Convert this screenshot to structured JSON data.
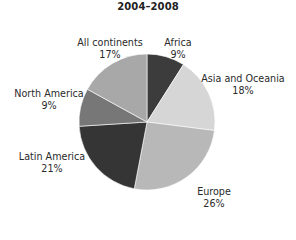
{
  "title": "2004–2008",
  "chart_data": {
    "type": "pie",
    "title": "2004–2008",
    "start_angle_deg": 0,
    "direction": "clockwise",
    "slices": [
      {
        "label": "Africa",
        "value": 9,
        "display": "9%",
        "color": "#3c3c3c"
      },
      {
        "label": "Asia and Oceania",
        "value": 18,
        "display": "18%",
        "color": "#d6d6d6"
      },
      {
        "label": "Europe",
        "value": 26,
        "display": "26%",
        "color": "#b8b8b8"
      },
      {
        "label": "Latin America",
        "value": 21,
        "display": "21%",
        "color": "#353535"
      },
      {
        "label": "North America",
        "value": 9,
        "display": "9%",
        "color": "#777777"
      },
      {
        "label": "All continents",
        "value": 17,
        "display": "17%",
        "color": "#a8a8a8"
      }
    ]
  },
  "labels": [
    {
      "name": "Africa",
      "pct": "9%",
      "x": 178,
      "y": 37
    },
    {
      "name": "Asia and Oceania",
      "pct": "18%",
      "x": 243,
      "y": 73
    },
    {
      "name": "Europe",
      "pct": "26%",
      "x": 214,
      "y": 186
    },
    {
      "name": "Latin America",
      "pct": "21%",
      "x": 52,
      "y": 151
    },
    {
      "name": "North America",
      "pct": "9%",
      "x": 49,
      "y": 88
    },
    {
      "name": "All continents",
      "pct": "17%",
      "x": 110,
      "y": 37
    }
  ]
}
